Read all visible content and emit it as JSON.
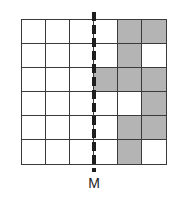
{
  "diagram": {
    "type": "grid-reflection",
    "rows": 6,
    "cols": 6,
    "shaded_cells": [
      [
        0,
        4
      ],
      [
        0,
        5
      ],
      [
        1,
        4
      ],
      [
        2,
        3
      ],
      [
        2,
        4
      ],
      [
        2,
        5
      ],
      [
        3,
        5
      ],
      [
        4,
        4
      ],
      [
        4,
        5
      ],
      [
        5,
        4
      ]
    ],
    "mirror_line": {
      "style": "dashed",
      "orientation": "vertical",
      "position_between_cols": [
        2,
        3
      ],
      "label": "M"
    },
    "colors": {
      "shaded": "#b4b4b4",
      "grid_line": "#3a3a3a",
      "mirror_line": "#1e1e1e"
    }
  }
}
